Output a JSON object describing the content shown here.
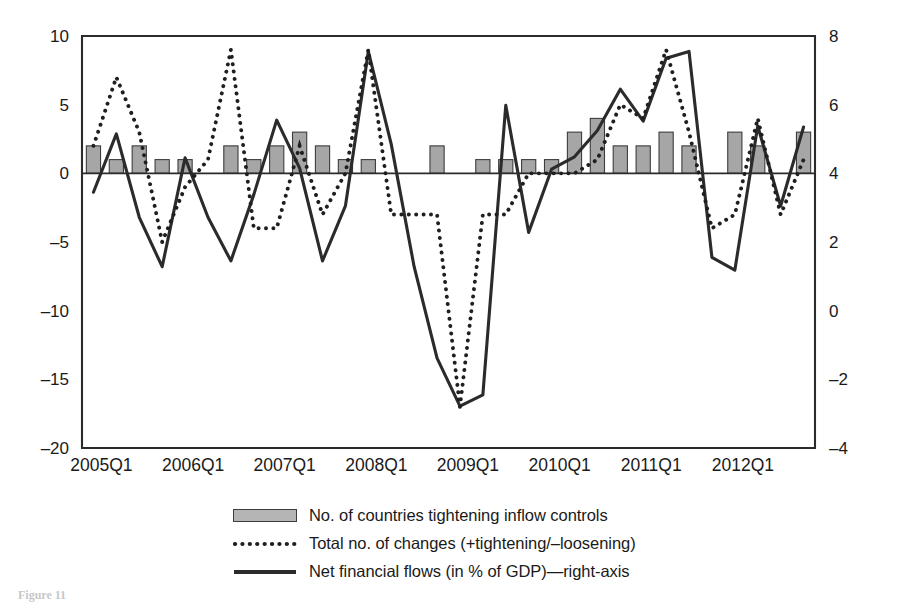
{
  "chart_data": {
    "type": "bar",
    "title": "",
    "xlabel": "",
    "ylabel": "",
    "grid": false,
    "legend_position": "bottom-center",
    "x": [
      "2005Q1",
      "2005Q2",
      "2005Q3",
      "2005Q4",
      "2006Q1",
      "2006Q2",
      "2006Q3",
      "2006Q4",
      "2007Q1",
      "2007Q2",
      "2007Q3",
      "2007Q4",
      "2008Q1",
      "2008Q2",
      "2008Q3",
      "2008Q4",
      "2009Q1",
      "2009Q2",
      "2009Q3",
      "2009Q4",
      "2010Q1",
      "2010Q2",
      "2010Q3",
      "2010Q4",
      "2011Q1",
      "2011Q2",
      "2011Q3",
      "2011Q4",
      "2012Q1",
      "2012Q2",
      "2012Q3",
      "2012Q4"
    ],
    "x_tick_labels": [
      "2005Q1",
      "2006Q1",
      "2007Q1",
      "2008Q1",
      "2009Q1",
      "2010Q1",
      "2011Q1",
      "2012Q1"
    ],
    "x_tick_indices": [
      0,
      4,
      8,
      12,
      16,
      20,
      24,
      28
    ],
    "left_axis": {
      "ticks": [
        "10",
        "5",
        "0",
        "-5",
        "-10",
        "-15",
        "-20"
      ],
      "values": [
        10,
        5,
        0,
        -5,
        -10,
        -15,
        -20
      ],
      "ylim": [
        -20,
        10
      ]
    },
    "right_axis": {
      "ticks": [
        "8",
        "6",
        "4",
        "2",
        "0",
        "-2",
        "-4"
      ],
      "values": [
        8,
        6,
        4,
        2,
        0,
        -2,
        -4
      ],
      "ylim": [
        -4,
        8
      ]
    },
    "series": [
      {
        "name": "No. of countries tightening inflow controls",
        "type": "bar",
        "axis": "left",
        "color": "#a6a6a6",
        "values": [
          2,
          1,
          2,
          1,
          1,
          0,
          2,
          1,
          2,
          3,
          2,
          1,
          1,
          0,
          0,
          2,
          0,
          1,
          1,
          1,
          1,
          3,
          4,
          2,
          2,
          3,
          2,
          0,
          3,
          2,
          0,
          3
        ]
      },
      {
        "name": "Total no. of changes (+tightening/-loosening)",
        "type": "line",
        "style": "dotted",
        "axis": "left",
        "color": "#1f1f1f",
        "values": [
          2,
          7,
          3,
          -5,
          -1,
          1,
          9,
          -4,
          -4,
          2,
          -3,
          0,
          9,
          -3,
          -3,
          -3,
          -17,
          -3,
          -3,
          0,
          0,
          0,
          1,
          5,
          4,
          9,
          3,
          -4,
          -3,
          4,
          -3,
          1
        ]
      },
      {
        "name": "Net financial flows (in % of GDP)-right-axis",
        "type": "line",
        "style": "solid",
        "axis": "right",
        "color": "#2b2b2b",
        "values": [
          3.45,
          5.15,
          2.72,
          1.28,
          4.45,
          2.72,
          1.45,
          3.38,
          5.55,
          4.15,
          1.45,
          3.05,
          7.55,
          4.85,
          1.28,
          -1.38,
          -2.78,
          -2.45,
          5.98,
          2.28,
          4.12,
          4.48,
          5.25,
          6.45,
          5.52,
          7.35,
          7.55,
          1.55,
          1.18,
          5.38,
          3.05,
          5.35
        ]
      }
    ]
  },
  "legend": {
    "items": [
      {
        "key": "bar-swatch",
        "label": "No. of countries tightening inflow controls"
      },
      {
        "key": "dotted-line-swatch",
        "label": "Total no. of changes (+tightening/–loosening)"
      },
      {
        "key": "solid-line-swatch",
        "label": "Net financial flows (in % of GDP)—right-axis"
      }
    ]
  },
  "caption": "Figure 11"
}
